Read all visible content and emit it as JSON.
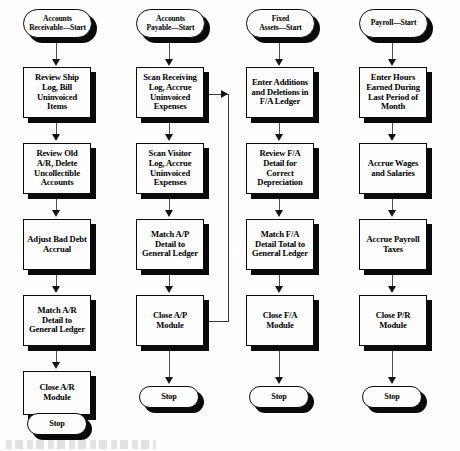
{
  "diagram": {
    "type": "flowchart",
    "orientation": "top-to-bottom, four parallel swimlane columns",
    "style": {
      "node_fill": "#fdfdfd",
      "node_border": "#0b0b0b",
      "node_shadow": "#0a0a0a",
      "connector": "#4e4e4e",
      "arrowhead": "#131313",
      "background": "#ffffff"
    }
  },
  "columns": [
    {
      "id": "accounts-receivable",
      "name": "Accounts Receivable",
      "start": "Accounts\nReceivable—Start",
      "steps": [
        "Review Ship\nLog, Bill\nUninvoiced\nItems",
        "Review Old\nA/R, Delete\nUncollectible\nAccounts",
        "Adjust Bad Debt\nAccrual",
        "Match A/R\nDetail to\nGeneral Ledger",
        "Close A/R\nModule"
      ],
      "stop": "Stop"
    },
    {
      "id": "accounts-payable",
      "name": "Accounts Payable",
      "start": "Accounts\nPayable—Start",
      "steps": [
        "Scan Receiving\nLog, Accrue\nUninvoiced\nExpenses",
        "Scan Visitor\nLog, Accrue\nUninvoiced\nExpenses",
        "Match A/P\nDetail to\nGeneral Ledger",
        "Close A/P\nModule"
      ],
      "stop": "Stop"
    },
    {
      "id": "fixed-assets",
      "name": "Fixed Assets",
      "start": "Fixed\nAssets—Start",
      "steps": [
        "Enter Additions\nand Deletions in\nF/A Ledger",
        "Review F/A\nDetail for\nCorrect\nDepreciation",
        "Match F/A\nDetail Total to\nGeneral Ledger",
        "Close F/A\nModule"
      ],
      "stop": "Stop"
    },
    {
      "id": "payroll",
      "name": "Payroll",
      "start": "Payroll—Start",
      "steps": [
        "Enter Hours\nEarned During\nLast Period of\nMonth",
        "Accrue Wages\nand Salaries",
        "Accrue Payroll\nTaxes",
        "Close P/R\nModule"
      ],
      "stop": "Stop"
    }
  ],
  "cross_connectors": [
    {
      "id": "ap-close-to-fa-enter",
      "from": "Close A/P Module",
      "to": "Enter Additions and Deletions in F/A Ledger",
      "route": "right from source, up, then right into target left edge",
      "arrow": "right"
    }
  ]
}
